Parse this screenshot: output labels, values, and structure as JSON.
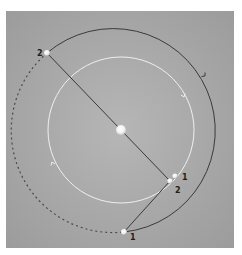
{
  "diagram": {
    "type": "orbital-geometry",
    "colors": {
      "background": "#ffffff",
      "panel": "#9e9e9e",
      "panel_highlight": "#b4b4b4",
      "outer_orbit": "#3a3a3a",
      "inner_orbit": "#f2f2f2",
      "dashed_orbit": "#4a4a4a",
      "connector_line": "#3a3a3a",
      "sphere": "#ffffff",
      "label": "#1e1e1e"
    },
    "central_body": {
      "x": 121,
      "y": 130,
      "r": 5
    },
    "inner_orbit": {
      "cx": 121,
      "cy": 130,
      "r": 73,
      "arrow_positions": [
        "upper-right",
        "lower-left"
      ]
    },
    "outer_orbit": {
      "start": [
        47,
        53
      ],
      "end": [
        124,
        232
      ],
      "r": 102,
      "arrow_position": "right"
    },
    "dashed_orbit": {
      "start": [
        47,
        53
      ],
      "end": [
        124,
        232
      ]
    },
    "points": [
      {
        "id": "outer-2",
        "label": "2",
        "x": 47,
        "y": 53,
        "label_x": 37,
        "label_y": 56
      },
      {
        "id": "outer-1",
        "label": "1",
        "x": 124,
        "y": 232,
        "label_x": 130,
        "label_y": 240
      },
      {
        "id": "inner-1",
        "label": "1",
        "x": 175,
        "y": 176,
        "label_x": 182,
        "label_y": 180
      },
      {
        "id": "inner-2",
        "label": "2",
        "x": 170,
        "y": 181,
        "label_x": 175,
        "label_y": 193
      }
    ]
  }
}
